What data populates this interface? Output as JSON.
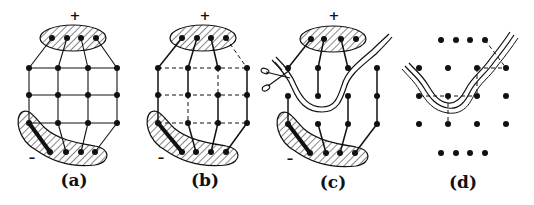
{
  "figure": {
    "panels": [
      {
        "id": "a",
        "label": "(a)",
        "plus": "+",
        "minus": "–",
        "description": "Full grid network with all edges solid, connecting positive terminal group to negative terminal group"
      },
      {
        "id": "b",
        "label": "(b)",
        "plus": "+",
        "minus": "–",
        "description": "Same grid with some edges dashed (removed), leaving solid paths from + to -"
      },
      {
        "id": "c",
        "label": "(c)",
        "plus": "+",
        "minus": "–",
        "description": "Network with dashed edges removed and a cut (double line) made by scissors separating + and - regions"
      },
      {
        "id": "d",
        "label": "(d)",
        "plus": "",
        "minus": "",
        "description": "Dot lattice with dashed dual edges crossing the cut line"
      }
    ],
    "icons": [
      "scissors-icon"
    ],
    "colors": {
      "ink": "#111111",
      "hatch": "#333333",
      "background": "#ffffff"
    }
  }
}
